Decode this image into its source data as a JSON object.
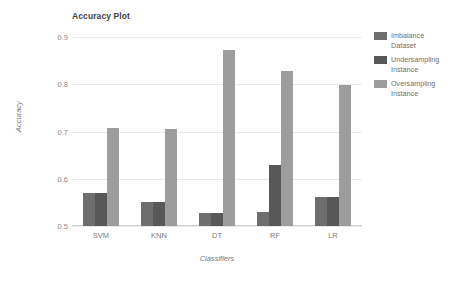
{
  "chart_data": {
    "type": "bar",
    "title": "Accuracy Plot",
    "xlabel": "Classifiers",
    "ylabel": "Accuracy",
    "categories": [
      "SVM",
      "KNN",
      "DT",
      "RF",
      "LR"
    ],
    "series": [
      {
        "name": "Imbalance Dataset",
        "color": "#6e6e6e",
        "values": [
          0.57,
          0.55,
          0.527,
          0.53,
          0.562
        ]
      },
      {
        "name": "Undersampling Instance",
        "color": "#585858",
        "values": [
          0.57,
          0.55,
          0.527,
          0.63,
          0.562
        ]
      },
      {
        "name": "Oversampling Instance",
        "color": "#9d9d9d",
        "values": [
          0.708,
          0.705,
          0.872,
          0.828,
          0.798
        ]
      }
    ],
    "ylim": [
      0.5,
      0.9
    ],
    "yticks": [
      0.9,
      0.8,
      0.7,
      0.6,
      0.5
    ],
    "ytick_labels": [
      "0.9",
      "0.8",
      "0.7",
      "0.6",
      "0.5"
    ],
    "grid": true,
    "legend_position": "right"
  },
  "legend": {
    "entries": [
      {
        "line1": "Imbalance",
        "line2": "Dataset"
      },
      {
        "line1": "Undersampling",
        "line2": "Instance"
      },
      {
        "line1": "Oversampling",
        "line2": "Instance"
      }
    ]
  }
}
